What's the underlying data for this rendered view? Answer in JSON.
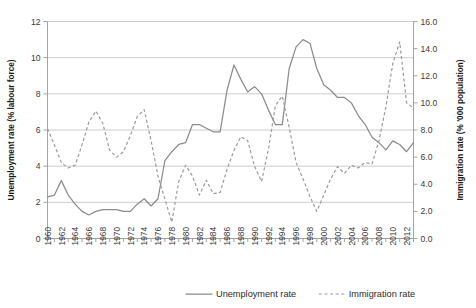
{
  "chart_data": {
    "type": "line",
    "title": "",
    "subtitle": "",
    "xlabel": "",
    "ylabel": "Unemployment rate (% labour force)",
    "y2label": "Immigration rate (% '000 population)",
    "ylim": [
      0,
      12
    ],
    "y2lim": [
      0.0,
      16.0
    ],
    "xlim": [
      1960,
      2013
    ],
    "grid": true,
    "legend_position": "bottom",
    "y_ticks": [
      "0",
      "2",
      "4",
      "6",
      "8",
      "10",
      "12"
    ],
    "y2_ticks": [
      "0.0",
      "2.0",
      "4.0",
      "6.0",
      "8.0",
      "10.0",
      "12.0",
      "14.0",
      "16.0"
    ],
    "x": [
      1960,
      1961,
      1962,
      1963,
      1964,
      1965,
      1966,
      1967,
      1968,
      1969,
      1970,
      1971,
      1972,
      1973,
      1974,
      1975,
      1976,
      1977,
      1978,
      1979,
      1980,
      1981,
      1982,
      1983,
      1984,
      1985,
      1986,
      1987,
      1988,
      1989,
      1990,
      1991,
      1992,
      1993,
      1994,
      1995,
      1996,
      1997,
      1998,
      1999,
      2000,
      2001,
      2002,
      2003,
      2004,
      2005,
      2006,
      2007,
      2008,
      2009,
      2010,
      2011,
      2012,
      2013
    ],
    "x_tick_labels": [
      "1960",
      "1962",
      "1964",
      "1966",
      "1968",
      "1970",
      "1972",
      "1974",
      "1976",
      "1978",
      "1980",
      "1982",
      "1984",
      "1986",
      "1988",
      "1990",
      "1992",
      "1994",
      "1996",
      "1998",
      "2000",
      "2002",
      "2004",
      "2006",
      "2008",
      "2010",
      "2012"
    ],
    "series": [
      {
        "name": "Unemployment rate",
        "axis": "left",
        "style": "solid",
        "color": "#8c8c8c",
        "units": "% labour force",
        "values": [
          2.3,
          2.4,
          3.2,
          2.4,
          1.9,
          1.5,
          1.3,
          1.5,
          1.6,
          1.6,
          1.6,
          1.5,
          1.5,
          1.9,
          2.2,
          1.8,
          2.2,
          4.3,
          4.8,
          5.2,
          5.3,
          6.3,
          6.3,
          6.1,
          5.9,
          5.9,
          8.2,
          9.6,
          8.8,
          8.1,
          8.4,
          8.0,
          7.1,
          6.3,
          6.3,
          9.4,
          10.6,
          11.0,
          10.8,
          9.4,
          8.5,
          8.2,
          7.8,
          7.8,
          7.5,
          6.8,
          6.3,
          5.6,
          5.3,
          4.9,
          5.4,
          5.2,
          4.8,
          5.3
        ],
        "notes": "Rises sharply from ~2 in the 1970s to ~9.6 in 1987, dips to ~6.3 in 1993-1994, peaks ~11.0 in 1997, then declines to ~5 by 2009."
      },
      {
        "name": "Immigration rate",
        "axis": "right",
        "style": "dashed",
        "color": "#9c9c9c",
        "units": "% '000 population",
        "values": [
          8.1,
          6.9,
          5.6,
          5.2,
          5.4,
          6.9,
          8.6,
          9.4,
          8.5,
          6.5,
          6.0,
          6.4,
          7.6,
          9.0,
          9.5,
          7.2,
          4.6,
          2.9,
          1.2,
          4.2,
          5.4,
          4.6,
          3.2,
          4.3,
          3.3,
          3.4,
          5.1,
          6.5,
          7.5,
          7.2,
          5.3,
          4.2,
          6.6,
          9.8,
          10.5,
          8.2,
          5.6,
          4.4,
          3.1,
          2.0,
          3.2,
          4.4,
          5.3,
          4.8,
          5.4,
          5.2,
          5.6,
          5.5,
          7.2,
          9.7,
          12.9,
          14.5,
          10.0,
          9.6
        ],
        "notes": "Oscillating dashed series; trough ~1.2 in 1978-79, peaks ~14.5 in 2008-09, ending ~9.6."
      }
    ]
  },
  "legend": {
    "items": [
      {
        "label": "Unemployment rate",
        "marker": "solid-line"
      },
      {
        "label": "Immigration rate",
        "marker": "dashed-line"
      }
    ]
  },
  "axes": {
    "left": {
      "title": "Unemployment rate (% labour force)"
    },
    "right": {
      "title": "Immigration rate (% '000 population)"
    }
  }
}
